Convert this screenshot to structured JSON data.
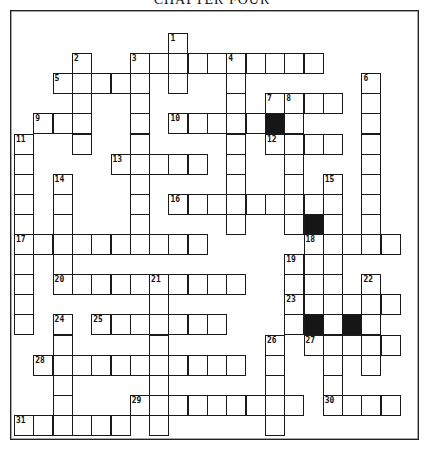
{
  "title": "CHAPTER FOUR",
  "grid": {
    "origin_x": 14,
    "origin_y": 33,
    "cell_w": 19.3,
    "cell_h": 20.1,
    "cols": 20,
    "rows": 20
  },
  "words": [
    {
      "num": 1,
      "dir": "down",
      "row": 0,
      "col": 8,
      "len": 3
    },
    {
      "num": 2,
      "dir": "down",
      "row": 1,
      "col": 3,
      "len": 5
    },
    {
      "num": 3,
      "dir": "across",
      "row": 1,
      "col": 6,
      "len": 10
    },
    {
      "num": 3,
      "dir": "down",
      "row": 1,
      "col": 6,
      "len": 10
    },
    {
      "num": 4,
      "dir": "down",
      "row": 1,
      "col": 11,
      "len": 9
    },
    {
      "num": 5,
      "dir": "across",
      "row": 2,
      "col": 2,
      "len": 5
    },
    {
      "num": 6,
      "dir": "down",
      "row": 2,
      "col": 18,
      "len": 9
    },
    {
      "num": 7,
      "dir": "across",
      "row": 3,
      "col": 13,
      "len": 4
    },
    {
      "num": 8,
      "dir": "down",
      "row": 3,
      "col": 14,
      "len": 7
    },
    {
      "num": 9,
      "dir": "across",
      "row": 4,
      "col": 1,
      "len": 3
    },
    {
      "num": 10,
      "dir": "across",
      "row": 4,
      "col": 8,
      "len": 5
    },
    {
      "num": 11,
      "dir": "down",
      "row": 5,
      "col": 0,
      "len": 10
    },
    {
      "num": 12,
      "dir": "across",
      "row": 5,
      "col": 13,
      "len": 4
    },
    {
      "num": 13,
      "dir": "across",
      "row": 6,
      "col": 5,
      "len": 5
    },
    {
      "num": 14,
      "dir": "down",
      "row": 7,
      "col": 2,
      "len": 6
    },
    {
      "num": 15,
      "dir": "down",
      "row": 7,
      "col": 16,
      "len": 12
    },
    {
      "num": 16,
      "dir": "across",
      "row": 8,
      "col": 8,
      "len": 9
    },
    {
      "num": 17,
      "dir": "across",
      "row": 10,
      "col": 0,
      "len": 10
    },
    {
      "num": 18,
      "dir": "across",
      "row": 10,
      "col": 15,
      "len": 5
    },
    {
      "num": 18,
      "dir": "down",
      "row": 10,
      "col": 15,
      "len": 3
    },
    {
      "num": 19,
      "dir": "down",
      "row": 11,
      "col": 14,
      "len": 4
    },
    {
      "num": 20,
      "dir": "across",
      "row": 12,
      "col": 2,
      "len": 10
    },
    {
      "num": 21,
      "dir": "down",
      "row": 12,
      "col": 7,
      "len": 8
    },
    {
      "num": 22,
      "dir": "down",
      "row": 12,
      "col": 18,
      "len": 5
    },
    {
      "num": 23,
      "dir": "across",
      "row": 13,
      "col": 14,
      "len": 6
    },
    {
      "num": 24,
      "dir": "down",
      "row": 14,
      "col": 2,
      "len": 5
    },
    {
      "num": 25,
      "dir": "across",
      "row": 14,
      "col": 4,
      "len": 7
    },
    {
      "num": 26,
      "dir": "down",
      "row": 15,
      "col": 13,
      "len": 5
    },
    {
      "num": 27,
      "dir": "across",
      "row": 15,
      "col": 15,
      "len": 5
    },
    {
      "num": 28,
      "dir": "across",
      "row": 16,
      "col": 1,
      "len": 11
    },
    {
      "num": 29,
      "dir": "across",
      "row": 18,
      "col": 6,
      "len": 9
    },
    {
      "num": 30,
      "dir": "across",
      "row": 18,
      "col": 16,
      "len": 4
    },
    {
      "num": 31,
      "dir": "across",
      "row": 19,
      "col": 0,
      "len": 6
    }
  ],
  "extra_cells": [
    {
      "row": 14,
      "col": 16
    },
    {
      "row": 14,
      "col": 18
    }
  ],
  "black_cells": [
    {
      "row": 4,
      "col": 13
    },
    {
      "row": 9,
      "col": 15
    },
    {
      "row": 14,
      "col": 15
    },
    {
      "row": 14,
      "col": 17
    }
  ]
}
